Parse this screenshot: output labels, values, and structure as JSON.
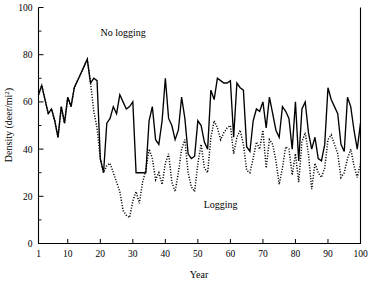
{
  "chart_data": {
    "type": "line",
    "title": "",
    "xlabel": "Year",
    "ylabel": "Density (deer/mi2)",
    "ylabel_base": "Density (deer/mi",
    "ylabel_sup": "2",
    "ylabel_tail": ")",
    "xlim": [
      1,
      100
    ],
    "ylim": [
      0,
      100
    ],
    "grid": false,
    "legend_position": "inline-annotations",
    "x_ticks": [
      1,
      10,
      20,
      30,
      40,
      50,
      60,
      70,
      80,
      90,
      100
    ],
    "x_tick_labels": [
      "1",
      "10",
      "20",
      "30",
      "40",
      "50",
      "60",
      "70",
      "80",
      "90",
      "100"
    ],
    "y_ticks": [
      0,
      20,
      40,
      60,
      80,
      100
    ],
    "y_tick_labels": [
      "0",
      "20",
      "40",
      "60",
      "80",
      "100"
    ],
    "y_minor_ticks": [
      10,
      30,
      50,
      70,
      90
    ],
    "colors": {
      "no_logging": "#000000",
      "logging": "#000000",
      "background": "#ffffff",
      "axis": "#000000"
    },
    "annotations": [
      {
        "text": "No logging",
        "x": 27,
        "y": 88
      },
      {
        "text": "Logging",
        "x": 57,
        "y": 15
      }
    ],
    "x": [
      1,
      2,
      3,
      4,
      5,
      6,
      7,
      8,
      9,
      10,
      11,
      12,
      13,
      14,
      15,
      16,
      17,
      18,
      19,
      20,
      21,
      22,
      23,
      24,
      25,
      26,
      27,
      28,
      29,
      30,
      31,
      32,
      33,
      34,
      35,
      36,
      37,
      38,
      39,
      40,
      41,
      42,
      43,
      44,
      45,
      46,
      47,
      48,
      49,
      50,
      51,
      52,
      53,
      54,
      55,
      56,
      57,
      58,
      59,
      60,
      61,
      62,
      63,
      64,
      65,
      66,
      67,
      68,
      69,
      70,
      71,
      72,
      73,
      74,
      75,
      76,
      77,
      78,
      79,
      80,
      81,
      82,
      83,
      84,
      85,
      86,
      87,
      88,
      89,
      90,
      91,
      92,
      93,
      94,
      95,
      96,
      97,
      98,
      99,
      100
    ],
    "series": [
      {
        "name": "No logging",
        "style": "solid",
        "values": [
          63,
          67,
          61,
          55,
          57,
          52,
          45,
          58,
          51,
          62,
          58,
          66,
          69,
          72,
          75,
          78,
          68,
          70,
          69,
          36,
          30,
          51,
          53,
          58,
          55,
          63,
          60,
          57,
          58,
          60,
          30,
          30,
          30,
          30,
          52,
          58,
          44,
          42,
          52,
          70,
          53,
          50,
          44,
          48,
          62,
          53,
          38,
          36,
          37,
          52,
          50,
          43,
          40,
          65,
          61,
          70,
          69,
          68,
          68,
          69,
          45,
          68,
          66,
          65,
          41,
          39,
          52,
          57,
          56,
          60,
          49,
          62,
          55,
          48,
          45,
          58,
          56,
          53,
          40,
          60,
          35,
          57,
          60,
          47,
          40,
          45,
          36,
          35,
          42,
          66,
          61,
          58,
          55,
          42,
          39,
          62,
          58,
          48,
          40,
          51
        ],
        "note": "Solid trace. Identical to logging series for years 1-17, then maintained at higher density."
      },
      {
        "name": "Logging",
        "style": "dotted",
        "values": [
          63,
          67,
          61,
          55,
          57,
          52,
          45,
          58,
          51,
          62,
          58,
          66,
          69,
          72,
          75,
          78,
          68,
          56,
          49,
          36,
          30,
          33,
          34,
          30,
          26,
          22,
          14,
          12,
          11,
          18,
          22,
          17,
          26,
          31,
          40,
          36,
          27,
          30,
          25,
          34,
          38,
          26,
          22,
          30,
          40,
          44,
          30,
          24,
          22,
          34,
          42,
          32,
          30,
          45,
          52,
          49,
          44,
          47,
          49,
          50,
          38,
          45,
          48,
          42,
          31,
          30,
          36,
          43,
          40,
          48,
          32,
          44,
          42,
          35,
          25,
          32,
          41,
          40,
          29,
          38,
          26,
          43,
          47,
          38,
          23,
          34,
          30,
          28,
          32,
          44,
          46,
          42,
          38,
          28,
          30,
          36,
          40,
          33,
          28,
          34
        ],
        "note": "Dotted trace. Diverges downward after year 17, minimum ~11 near year 29, then fluctuates below the no-logging series."
      }
    ]
  }
}
